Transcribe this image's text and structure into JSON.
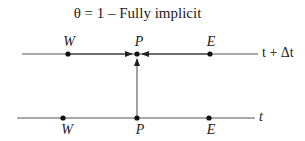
{
  "title": "θ = 1 – Fully implicit",
  "top_row": {
    "time_label": "t + Δt",
    "nodes": [
      {
        "label": "W",
        "x": 68
      },
      {
        "label": "P",
        "x": 137
      },
      {
        "label": "E",
        "x": 210
      }
    ]
  },
  "bottom_row": {
    "time_label": "t",
    "nodes": [
      {
        "label": "W",
        "x": 63
      },
      {
        "label": "P",
        "x": 137
      },
      {
        "label": "E",
        "x": 209
      }
    ]
  },
  "colors": {
    "line": "#444444",
    "dot": "#111111"
  }
}
